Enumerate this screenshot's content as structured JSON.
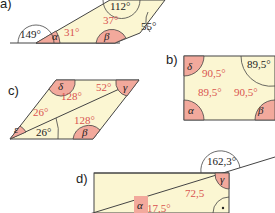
{
  "colors": {
    "fill": "#fbf6d2",
    "wedge": "#f2a99c",
    "stroke": "#444444",
    "red_text": "#d9534f"
  },
  "figures": [
    {
      "label": "a)",
      "angles": {
        "exterior_left": "149°",
        "alpha_label": "α",
        "alpha_value": "31°",
        "top": "112°",
        "beta_label": "β",
        "beta_value": "37°",
        "right": "55°"
      }
    },
    {
      "label": "b)",
      "angles": {
        "delta_label": "δ",
        "delta_value": "90,5°",
        "top_right": "89,5°",
        "alpha_label": "α",
        "alpha_value": "89,5°",
        "beta_label": "β",
        "beta_value": "90,5°"
      }
    },
    {
      "label": "c)",
      "angles": {
        "delta_label": "δ",
        "delta_value": "128°",
        "gamma_label": "γ",
        "gamma_value": "52°",
        "epsilon_label": "ε",
        "epsilon_value": "26°",
        "bottom_left": "26°",
        "beta_label": "β",
        "beta_value": "128°"
      }
    },
    {
      "label": "d)",
      "angles": {
        "exterior_top": "162,3°",
        "gamma_label": "γ",
        "gamma_value": "72,5",
        "alpha_label": "α",
        "alpha_value": "17,5°",
        "right_angle_mark": "·"
      }
    }
  ]
}
